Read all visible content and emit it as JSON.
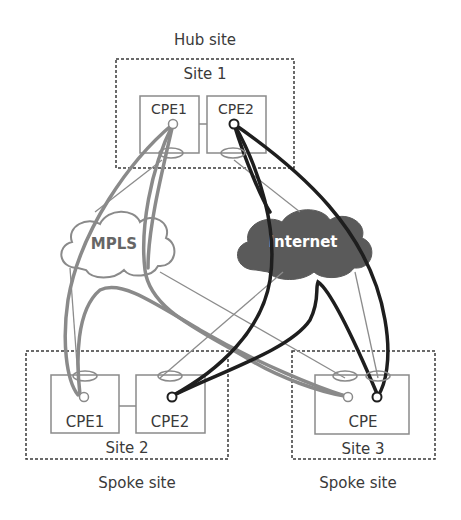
{
  "title": "Hub site",
  "colors": {
    "mpls_line": "#8a8a8a",
    "internet_line": "#1e1e1e",
    "thin_line": "#8c8c8c",
    "box_stroke": "#8a8a8a",
    "dotted": "#3a3a3a",
    "internet_fill": "#5a5a5a",
    "text": "#3a3a3a"
  },
  "clouds": {
    "mpls": {
      "label": "MPLS"
    },
    "internet": {
      "label": "Internet"
    }
  },
  "sites": {
    "site1": {
      "name": "Site 1",
      "role": "Hub site",
      "devices": [
        "CPE1",
        "CPE2"
      ]
    },
    "site2": {
      "name": "Site 2",
      "role": "Spoke site",
      "devices": [
        "CPE1",
        "CPE2"
      ]
    },
    "site3": {
      "name": "Site 3",
      "role": "Spoke site",
      "devices": [
        "CPE"
      ]
    }
  }
}
